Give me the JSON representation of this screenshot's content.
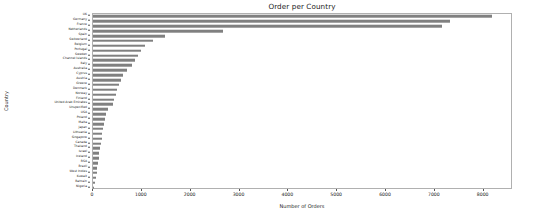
{
  "chart_data": {
    "type": "bar",
    "orientation": "horizontal",
    "title": "Order per Country",
    "xlabel": "Number of Orders",
    "ylabel": "Country",
    "xlim": [
      0,
      8600
    ],
    "grid": false,
    "legend": false,
    "bar_color": "#808080",
    "xticks": [
      0,
      1000,
      2000,
      3000,
      4000,
      5000,
      6000,
      7000,
      8000
    ],
    "categories": [
      "UK",
      "Germany",
      "France",
      "Netherlands",
      "Spain",
      "Switzerland",
      "Belgium",
      "Portugal",
      "Sweden",
      "Channel Islands",
      "Italy",
      "Australia",
      "Cyprus",
      "Austria",
      "Greece",
      "Denmark",
      "Norway",
      "Finland",
      "United Arab Emirates",
      "Unspecified",
      "USA",
      "Poland",
      "Malta",
      "Japan",
      "Lithuania",
      "Singapore",
      "Canada",
      "Thailand",
      "Israel",
      "Iceland",
      "RSA",
      "Brazil",
      "West Indies",
      "Kuwait",
      "Bahrain",
      "Nigeria"
    ],
    "values": [
      8180,
      7320,
      7140,
      2670,
      1480,
      1230,
      1060,
      980,
      930,
      870,
      800,
      690,
      620,
      580,
      540,
      500,
      470,
      440,
      410,
      300,
      270,
      250,
      230,
      210,
      190,
      175,
      160,
      145,
      130,
      115,
      100,
      85,
      72,
      58,
      45,
      30
    ]
  }
}
